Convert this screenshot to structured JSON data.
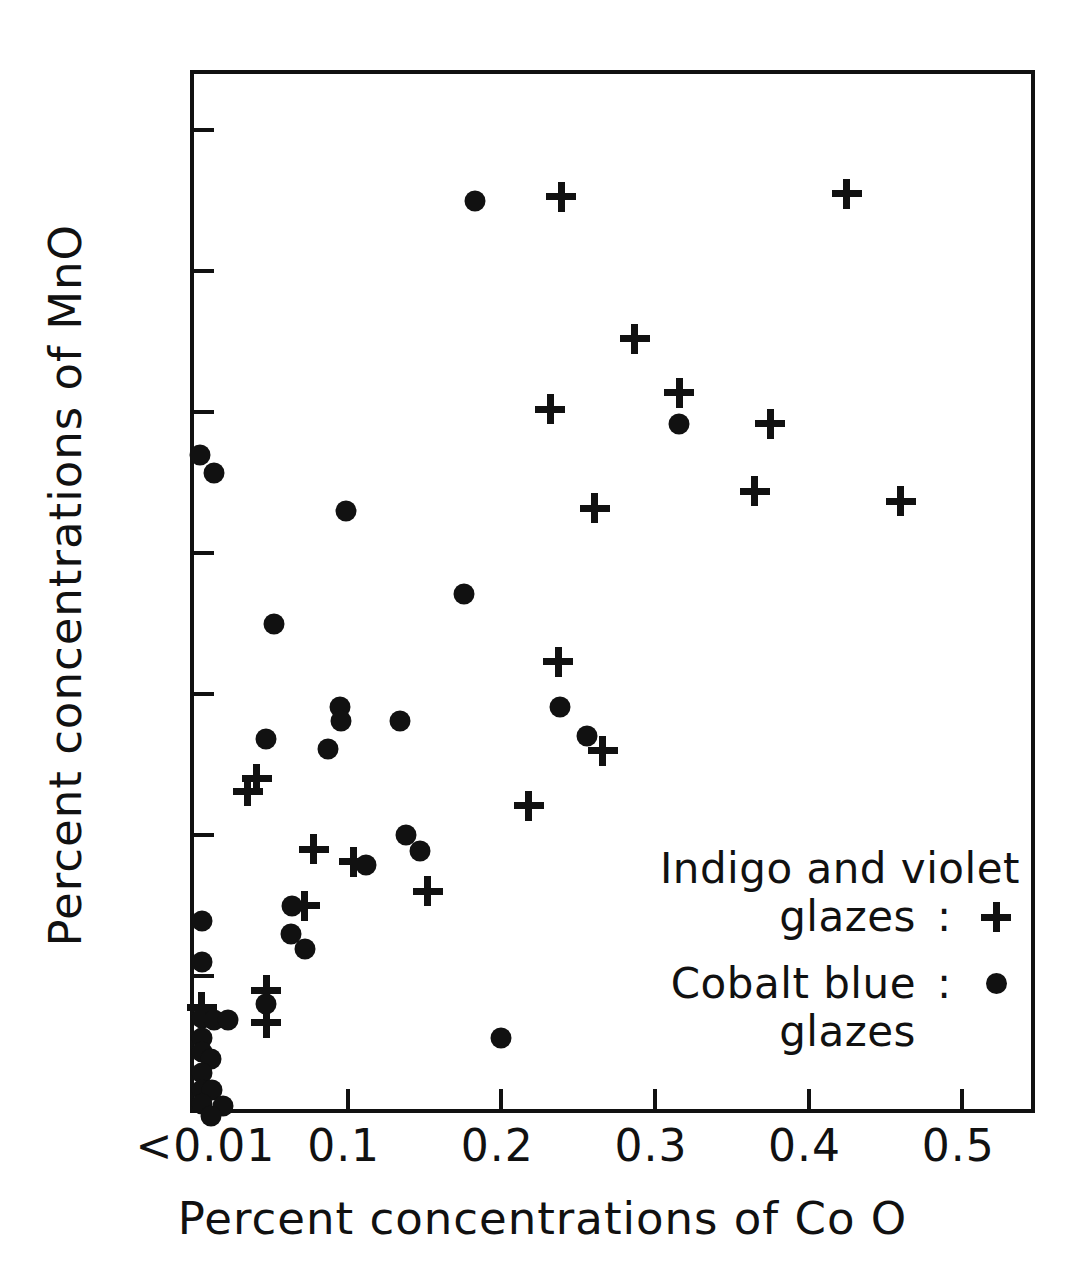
{
  "chart_data": {
    "type": "scatter",
    "title": "",
    "xlabel": "Percent concentrations of Co O",
    "ylabel": "Percent concentrations of MnO",
    "xlim": [
      0,
      0.55
    ],
    "ylim": [
      0,
      0.74
    ],
    "grid": false,
    "legend_position": "bottom-right",
    "x_tick_labels": [
      "<0.01",
      "0.1",
      "0.2",
      "0.3",
      "0.4",
      "0.5"
    ],
    "x_tick_values": [
      0.01,
      0.1,
      0.2,
      0.3,
      0.4,
      0.5
    ],
    "y_tick_labels": [
      "0",
      "0.1",
      "0.2",
      "0.3",
      "0.4",
      "0.5",
      "0.6",
      "0.7"
    ],
    "y_tick_values": [
      0,
      0.1,
      0.2,
      0.3,
      0.4,
      0.5,
      0.6,
      0.7
    ],
    "series": [
      {
        "name": "Cobalt blue glazes",
        "marker": "dot",
        "points": [
          [
            0.004,
            0.47
          ],
          [
            0.013,
            0.457
          ],
          [
            0.099,
            0.43
          ],
          [
            0.183,
            0.65
          ],
          [
            0.316,
            0.492
          ],
          [
            0.176,
            0.371
          ],
          [
            0.052,
            0.35
          ],
          [
            0.095,
            0.291
          ],
          [
            0.238,
            0.291
          ],
          [
            0.096,
            0.281
          ],
          [
            0.134,
            0.281
          ],
          [
            0.256,
            0.27
          ],
          [
            0.047,
            0.268
          ],
          [
            0.087,
            0.261
          ],
          [
            0.138,
            0.2
          ],
          [
            0.147,
            0.189
          ],
          [
            0.112,
            0.179
          ],
          [
            0.064,
            0.15
          ],
          [
            0.005,
            0.139
          ],
          [
            0.063,
            0.13
          ],
          [
            0.072,
            0.119
          ],
          [
            0.005,
            0.11
          ],
          [
            0.047,
            0.08
          ],
          [
            0.2,
            0.056
          ],
          [
            0.005,
            0.07
          ],
          [
            0.013,
            0.069
          ],
          [
            0.022,
            0.069
          ],
          [
            0.005,
            0.056
          ],
          [
            0.005,
            0.046
          ],
          [
            0.011,
            0.041
          ],
          [
            0.005,
            0.031
          ],
          [
            0.005,
            0.019
          ],
          [
            0.012,
            0.019
          ],
          [
            0.005,
            0.009
          ],
          [
            0.019,
            0.008
          ],
          [
            0.011,
            0.001
          ]
        ]
      },
      {
        "name": "Indigo and violet glazes",
        "marker": "plus",
        "points": [
          [
            0.239,
            0.653
          ],
          [
            0.425,
            0.655
          ],
          [
            0.287,
            0.552
          ],
          [
            0.316,
            0.514
          ],
          [
            0.232,
            0.502
          ],
          [
            0.375,
            0.492
          ],
          [
            0.365,
            0.444
          ],
          [
            0.46,
            0.437
          ],
          [
            0.261,
            0.432
          ],
          [
            0.237,
            0.323
          ],
          [
            0.266,
            0.26
          ],
          [
            0.218,
            0.221
          ],
          [
            0.041,
            0.24
          ],
          [
            0.035,
            0.231
          ],
          [
            0.078,
            0.19
          ],
          [
            0.104,
            0.181
          ],
          [
            0.152,
            0.16
          ],
          [
            0.072,
            0.15
          ],
          [
            0.047,
            0.09
          ],
          [
            0.047,
            0.067
          ],
          [
            0.005,
            0.078
          ]
        ]
      }
    ]
  },
  "legend": {
    "rows": [
      {
        "line1": "Indigo and violet",
        "line2": "glazes",
        "colon": ":",
        "symbol": "plus-icon"
      },
      {
        "line1": "Cobalt blue",
        "line2": "glazes",
        "colon": ":",
        "symbol": "dot-icon"
      }
    ]
  },
  "axes": {
    "x_title": "Percent concentrations of Co O",
    "y_title": "Percent concentrations of MnO"
  },
  "colors": {
    "ink": "#111111",
    "background": "#ffffff"
  }
}
